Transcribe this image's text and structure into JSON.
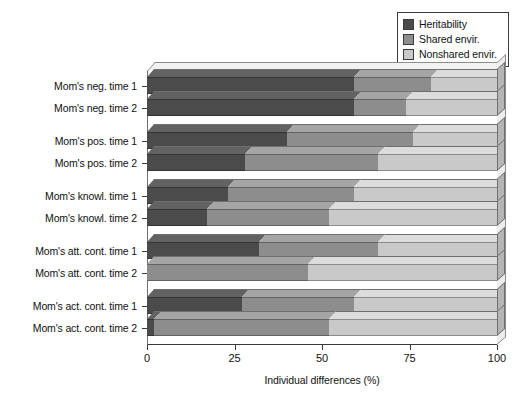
{
  "chart_data": {
    "type": "bar",
    "orientation": "horizontal",
    "stacked": true,
    "three_d": true,
    "title": "",
    "xlabel": "Individual differences (%)",
    "ylabel": "",
    "xlim": [
      0,
      100
    ],
    "xticks": [
      "0",
      "25",
      "50",
      "75",
      "100"
    ],
    "grid": false,
    "legend_position": "top-right",
    "categories": [
      "Mom's neg. time 1",
      "Mom's neg. time 2",
      "Mom's pos. time 1",
      "Mom's pos. time 2",
      "Mom's knowl. time 1",
      "Mom's knowl. time 2",
      "Mom's att. cont. time 1",
      "Mom's att. cont. time 2",
      "Mom's act. cont. time 1",
      "Mom's act. cont. time 2"
    ],
    "series": [
      {
        "name": "Heritability",
        "color": "#4b4b4b",
        "values": [
          59,
          59,
          40,
          28,
          23,
          17,
          32,
          0,
          27,
          2
        ]
      },
      {
        "name": "Shared envir.",
        "color": "#8d8d8d",
        "values": [
          22,
          15,
          36,
          38,
          36,
          35,
          34,
          46,
          32,
          50
        ]
      },
      {
        "name": "Nonshared envir.",
        "color": "#c9c9c9",
        "values": [
          19,
          26,
          24,
          34,
          41,
          48,
          34,
          54,
          41,
          48
        ]
      }
    ],
    "group_breaks_after": [
      1,
      3,
      5,
      7
    ]
  },
  "legend": {
    "items": [
      {
        "label": "Heritability",
        "swatch": "#4b4b4b"
      },
      {
        "label": "Shared envir.",
        "swatch": "#8d8d8d"
      },
      {
        "label": "Nonshared envir.",
        "swatch": "#c9c9c9"
      }
    ]
  },
  "axis": {
    "x_title": "Individual differences (%)",
    "x_ticks": [
      "0",
      "25",
      "50",
      "75",
      "100"
    ]
  }
}
